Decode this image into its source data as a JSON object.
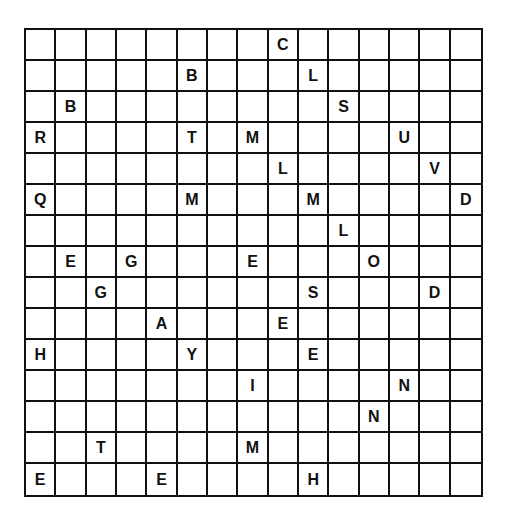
{
  "puzzle": {
    "type": "letter-grid",
    "rows": 15,
    "cols": 15,
    "grid": [
      [
        "",
        "",
        "",
        "",
        "",
        "",
        "",
        "",
        "C",
        "",
        "",
        "",
        "",
        "",
        ""
      ],
      [
        "",
        "",
        "",
        "",
        "",
        "B",
        "",
        "",
        "",
        "L",
        "",
        "",
        "",
        "",
        ""
      ],
      [
        "",
        "B",
        "",
        "",
        "",
        "",
        "",
        "",
        "",
        "",
        "S",
        "",
        "",
        "",
        ""
      ],
      [
        "R",
        "",
        "",
        "",
        "",
        "T",
        "",
        "M",
        "",
        "",
        "",
        "",
        "U",
        "",
        ""
      ],
      [
        "",
        "",
        "",
        "",
        "",
        "",
        "",
        "",
        "L",
        "",
        "",
        "",
        "",
        "V",
        ""
      ],
      [
        "Q",
        "",
        "",
        "",
        "",
        "M",
        "",
        "",
        "",
        "M",
        "",
        "",
        "",
        "",
        "D"
      ],
      [
        "",
        "",
        "",
        "",
        "",
        "",
        "",
        "",
        "",
        "",
        "L",
        "",
        "",
        "",
        ""
      ],
      [
        "",
        "E",
        "",
        "G",
        "",
        "",
        "",
        "E",
        "",
        "",
        "",
        "O",
        "",
        "",
        ""
      ],
      [
        "",
        "",
        "G",
        "",
        "",
        "",
        "",
        "",
        "",
        "S",
        "",
        "",
        "",
        "D",
        ""
      ],
      [
        "",
        "",
        "",
        "",
        "A",
        "",
        "",
        "",
        "E",
        "",
        "",
        "",
        "",
        "",
        ""
      ],
      [
        "H",
        "",
        "",
        "",
        "",
        "Y",
        "",
        "",
        "",
        "E",
        "",
        "",
        "",
        "",
        ""
      ],
      [
        "",
        "",
        "",
        "",
        "",
        "",
        "",
        "I",
        "",
        "",
        "",
        "",
        "N",
        "",
        ""
      ],
      [
        "",
        "",
        "",
        "",
        "",
        "",
        "",
        "",
        "",
        "",
        "",
        "N",
        "",
        "",
        ""
      ],
      [
        "",
        "",
        "T",
        "",
        "",
        "",
        "",
        "M",
        "",
        "",
        "",
        "",
        "",
        "",
        ""
      ],
      [
        "E",
        "",
        "",
        "",
        "E",
        "",
        "",
        "",
        "",
        "H",
        "",
        "",
        "",
        "",
        ""
      ]
    ]
  }
}
